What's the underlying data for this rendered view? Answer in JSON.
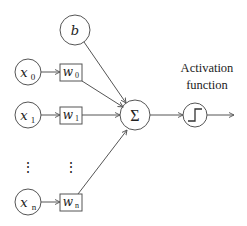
{
  "diagram": {
    "bias": {
      "label": "b"
    },
    "inputs": [
      {
        "x": "x",
        "x_sub": "0",
        "w": "w",
        "w_sub": "0"
      },
      {
        "x": "x",
        "x_sub": "1",
        "w": "w",
        "w_sub": "1"
      },
      {
        "x": "x",
        "x_sub": "n",
        "w": "w",
        "w_sub": "n"
      }
    ],
    "ellipsis": "⋮",
    "sum": {
      "label": "Σ"
    },
    "activation": {
      "label_line1": "Activation",
      "label_line2": "function",
      "icon": "step-function-icon"
    },
    "colors": {
      "stroke": "#555555",
      "text": "#222222",
      "background": "#ffffff"
    }
  }
}
